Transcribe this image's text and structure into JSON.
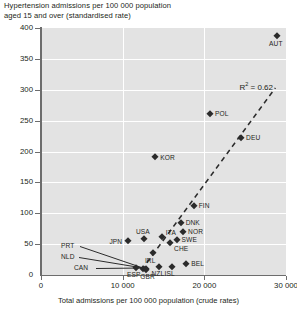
{
  "chart_data": {
    "type": "scatter",
    "title": "",
    "ylabel": "Hypertension admissions per 100 000 population aged 15 and over (standardised rate)",
    "ylabel_lines": [
      "Hypertension admissions per 100 000 population",
      "aged 15 and over (standardised rate)"
    ],
    "xlabel": "Total admissions per 100 000 population (crude rates)",
    "xlim": [
      0,
      30000
    ],
    "ylim": [
      0,
      400
    ],
    "xticks": [
      0,
      10000,
      20000,
      30000
    ],
    "xtick_labels": [
      "0",
      "10 000",
      "20 000",
      "30 000"
    ],
    "yticks": [
      0,
      50,
      100,
      150,
      200,
      250,
      300,
      350,
      400
    ],
    "ytick_labels": [
      "0",
      "50",
      "100",
      "150",
      "200",
      "250",
      "300",
      "350",
      "400"
    ],
    "grid": "horizontal and vertical white gridlines on grey panel",
    "legend": "none",
    "annotations": [
      {
        "name": "r-squared",
        "text": "R² = 0.62",
        "x": 26500,
        "y": 305
      }
    ],
    "trendline": {
      "style": "dashed",
      "x_start": 12300,
      "y_start": 8,
      "x_end": 28700,
      "y_end": 303
    },
    "points": [
      {
        "label": "AUT",
        "x": 28900,
        "y": 387,
        "label_pos": "below"
      },
      {
        "label": "POL",
        "x": 20700,
        "y": 261,
        "label_pos": "right"
      },
      {
        "label": "DEU",
        "x": 24500,
        "y": 222,
        "label_pos": "right"
      },
      {
        "label": "KOR",
        "x": 14000,
        "y": 191,
        "label_pos": "right"
      },
      {
        "label": "FIN",
        "x": 18700,
        "y": 112,
        "label_pos": "right"
      },
      {
        "label": "DNK",
        "x": 17100,
        "y": 85,
        "label_pos": "right"
      },
      {
        "label": "NOR",
        "x": 17400,
        "y": 70,
        "label_pos": "right"
      },
      {
        "label": "SWE",
        "x": 16600,
        "y": 57,
        "label_pos": "right"
      },
      {
        "label": "ITA",
        "x": 14800,
        "y": 62,
        "label_pos": "above-right"
      },
      {
        "label": "USA",
        "x": 12600,
        "y": 58,
        "label_pos": "above"
      },
      {
        "label": "JPN",
        "x": 10700,
        "y": 55,
        "label_pos": "left"
      },
      {
        "label": "CHE",
        "x": 15800,
        "y": 52,
        "label_pos": "below-right"
      },
      {
        "label": "IRL",
        "x": 13700,
        "y": 35,
        "label_pos": "below"
      },
      {
        "label": "BEL",
        "x": 17800,
        "y": 18,
        "label_pos": "right"
      },
      {
        "label": "ISL",
        "x": 16100,
        "y": 13,
        "label_pos": "below"
      },
      {
        "label": "NZL",
        "x": 14500,
        "y": 13,
        "label_pos": "below"
      },
      {
        "label": "CAN",
        "x": 11600,
        "y": 11,
        "label_pos": "left"
      },
      {
        "label": "ESP",
        "x": 12500,
        "y": 9,
        "label_pos": "below-left"
      },
      {
        "label": "GBR",
        "x": 12900,
        "y": 8,
        "label_pos": "below"
      },
      {
        "label": "PRT",
        "x": 12800,
        "y": 10,
        "label_pos": "leader-left"
      },
      {
        "label": "NLD",
        "x": 12800,
        "y": 10,
        "label_pos": "leader-left"
      }
    ],
    "leader_labels": [
      {
        "label": "PRT"
      },
      {
        "label": "NLD"
      },
      {
        "label": "CAN"
      }
    ],
    "colors": {
      "panel": "#e3e3e3",
      "grid": "#ffffff",
      "marker": "#2b2b2b",
      "axis": "#6d6d6d",
      "text": "#231f20"
    }
  }
}
